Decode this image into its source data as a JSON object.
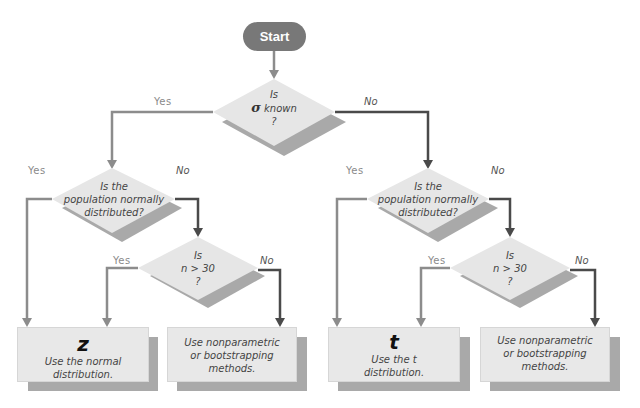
{
  "start": {
    "label": "Start"
  },
  "decisions": {
    "sigma_known": {
      "line1": "Is",
      "symbol": "σ",
      "line2": "known",
      "line3": "?"
    },
    "left_normal": {
      "line1": "Is the",
      "line2": "population normally",
      "line3": "distributed?"
    },
    "left_n30": {
      "line1": "Is",
      "line2": "n > 30",
      "line3": "?"
    },
    "right_normal": {
      "line1": "Is the",
      "line2": "population normally",
      "line3": "distributed?"
    },
    "right_n30": {
      "line1": "Is",
      "line2": "n > 30",
      "line3": "?"
    }
  },
  "branch_labels": {
    "sigma_yes": "Yes",
    "sigma_no": "No",
    "left_normal_yes": "Yes",
    "left_normal_no": "No",
    "left_n30_yes": "Yes",
    "left_n30_no": "No",
    "right_normal_yes": "Yes",
    "right_normal_no": "No",
    "right_n30_yes": "Yes",
    "right_n30_no": "No"
  },
  "outcomes": {
    "z": {
      "symbol": "z",
      "line1": "Use the normal",
      "line2": "distribution."
    },
    "left_nonparam": {
      "line1": "Use nonparametric",
      "line2": "or bootstrapping",
      "line3": "methods."
    },
    "t": {
      "symbol": "t",
      "line1": "Use the t",
      "line2": "distribution."
    },
    "right_nonparam": {
      "line1": "Use nonparametric",
      "line2": "or bootstrapping",
      "line3": "methods."
    }
  },
  "colors": {
    "start_fill": "#787878",
    "diamond_fill": "#e6e6e6",
    "shadow": "#a9a9a9",
    "yes_line": "#8c8c8c",
    "no_line": "#4a4a4a"
  }
}
